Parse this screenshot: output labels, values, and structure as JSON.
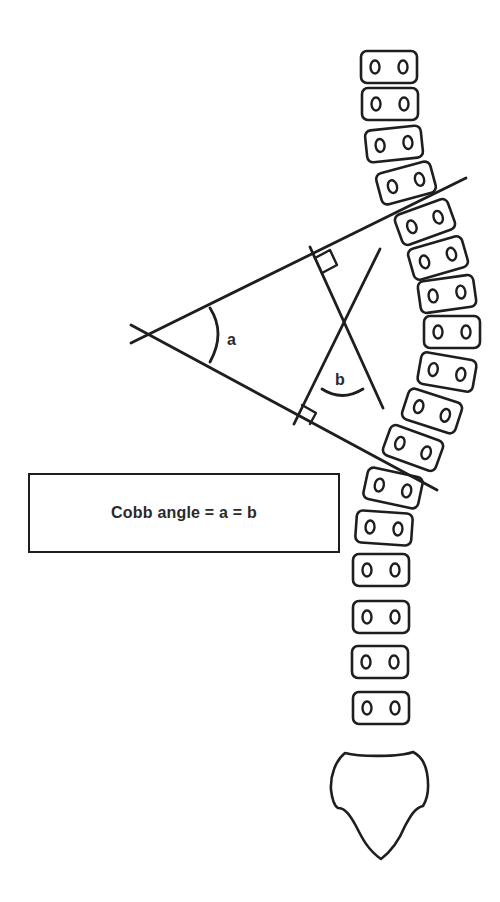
{
  "diagram": {
    "formula": "Cobb angle = a = b",
    "angle_labels": {
      "a": "a",
      "b": "b"
    },
    "colors": {
      "line": "#1e1e1e",
      "text": "#2a2a2a",
      "background": "#ffffff"
    },
    "endplate_lines": {
      "upper": {
        "x1": 131,
        "y1": 343,
        "x2": 466,
        "y2": 178
      },
      "lower": {
        "x1": 131,
        "y1": 325,
        "x2": 437,
        "y2": 490
      }
    },
    "perpendiculars": {
      "from_upper": {
        "x1": 310,
        "y1": 247,
        "x2": 383,
        "y2": 408
      },
      "from_lower": {
        "x1": 380,
        "y1": 249,
        "x2": 294,
        "y2": 424
      }
    },
    "vertebrae": [
      {
        "cx": 389,
        "cy": 67,
        "angle": 0
      },
      {
        "cx": 390,
        "cy": 104,
        "angle": 0
      },
      {
        "cx": 394,
        "cy": 144,
        "angle": -6
      },
      {
        "cx": 406,
        "cy": 183,
        "angle": -15
      },
      {
        "cx": 425,
        "cy": 222,
        "angle": -20
      },
      {
        "cx": 438,
        "cy": 258,
        "angle": -16
      },
      {
        "cx": 447,
        "cy": 294,
        "angle": -8
      },
      {
        "cx": 452,
        "cy": 332,
        "angle": 0
      },
      {
        "cx": 447,
        "cy": 372,
        "angle": 10
      },
      {
        "cx": 432,
        "cy": 411,
        "angle": 18
      },
      {
        "cx": 413,
        "cy": 448,
        "angle": 20
      },
      {
        "cx": 393,
        "cy": 488,
        "angle": 12
      },
      {
        "cx": 384,
        "cy": 528,
        "angle": 4
      },
      {
        "cx": 381,
        "cy": 570,
        "angle": 0
      },
      {
        "cx": 381,
        "cy": 617,
        "angle": 0
      },
      {
        "cx": 380,
        "cy": 662,
        "angle": 0
      },
      {
        "cx": 381,
        "cy": 708,
        "angle": 0
      }
    ]
  }
}
